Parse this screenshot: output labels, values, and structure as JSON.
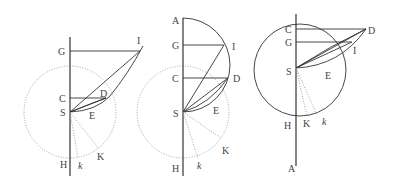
{
  "figure": {
    "panels": [
      {
        "id": "left",
        "labels": {
          "G": "G",
          "I": "I",
          "C": "C",
          "D": "D",
          "S": "S",
          "E": "E",
          "H": "H",
          "K": "K",
          "k": "k"
        }
      },
      {
        "id": "middle",
        "labels": {
          "A": "A",
          "G": "G",
          "I": "I",
          "C": "C",
          "D": "D",
          "S": "S",
          "E": "E",
          "H": "H",
          "K": "K",
          "k": "k"
        }
      },
      {
        "id": "right",
        "labels": {
          "C": "C",
          "D": "D",
          "G": "G",
          "I": "I",
          "S": "S",
          "E": "E",
          "H": "H",
          "K": "K",
          "k": "k",
          "A": "A"
        }
      }
    ]
  }
}
